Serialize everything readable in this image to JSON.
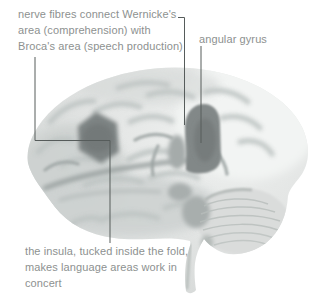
{
  "figure": {
    "type": "labeled-illustration"
  },
  "annotations": {
    "nerve_fibres": {
      "lines": [
        "nerve fibres connect Wernicke's",
        "area (comprehension) with",
        "Broca's area (speech production)"
      ]
    },
    "angular_gyrus": {
      "label": "angular gyrus"
    },
    "insula": {
      "lines": [
        "the insula, tucked inside the fold,",
        "makes language areas work in",
        "concert"
      ]
    }
  },
  "regions": {
    "broca_marker": "Broca's area (speech production)",
    "wernicke_marker": "Wernicke's area / angular gyrus",
    "insula_fold": "the insula (inside the fold)"
  },
  "colors": {
    "background": "#ffffff",
    "annotation_text": "#8d9190",
    "leader_line": "#565c5b",
    "brain_base": "#e0e2e1",
    "brain_shadow": "#c9cdcc",
    "dark_region": "#7d8383"
  }
}
